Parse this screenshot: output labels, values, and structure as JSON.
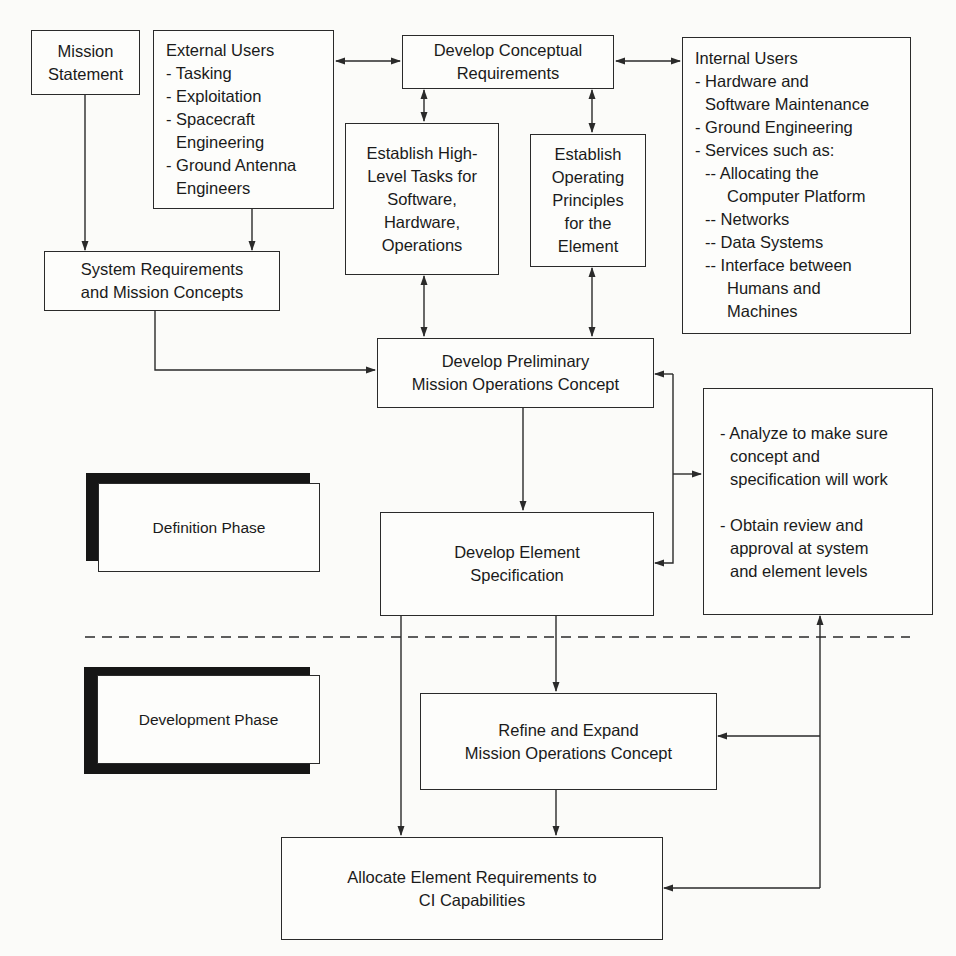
{
  "diagram": {
    "nodes": {
      "mission_statement": {
        "lines": [
          "Mission",
          "Statement"
        ]
      },
      "external_users": {
        "title": "External Users",
        "items": [
          "- Tasking",
          "- Exploitation",
          "- Spacecraft",
          "Engineering",
          "- Ground Antenna",
          "Engineers"
        ]
      },
      "develop_conceptual_requirements": {
        "lines": [
          "Develop Conceptual",
          "Requirements"
        ]
      },
      "internal_users": {
        "title": "Internal Users",
        "items": [
          "- Hardware and",
          "Software Maintenance",
          "- Ground Engineering",
          "- Services such as:",
          "-- Allocating the",
          "Computer Platform",
          "-- Networks",
          "-- Data Systems",
          "-- Interface between",
          "Humans and",
          "Machines"
        ]
      },
      "establish_high_level_tasks": {
        "lines": [
          "Establish High-",
          "Level Tasks for",
          "Software,",
          "Hardware,",
          "Operations"
        ]
      },
      "establish_operating_principles": {
        "lines": [
          "Establish",
          "Operating",
          "Principles",
          "for the",
          "Element"
        ]
      },
      "system_requirements": {
        "lines": [
          "System Requirements",
          "and Mission Concepts"
        ]
      },
      "develop_preliminary_moc": {
        "lines": [
          "Develop Preliminary",
          "Mission Operations Concept"
        ]
      },
      "analyze_review": {
        "items": [
          "- Analyze to make sure",
          "concept and",
          "specification will work",
          "- Obtain review and",
          "approval at system",
          "and element levels"
        ]
      },
      "develop_element_specification": {
        "lines": [
          "Develop Element",
          "Specification"
        ]
      },
      "refine_expand_moc": {
        "lines": [
          "Refine and Expand",
          "Mission Operations Concept"
        ]
      },
      "allocate_requirements": {
        "lines": [
          "Allocate Element Requirements to",
          "CI Capabilities"
        ]
      }
    },
    "phases": {
      "definition": {
        "label": "Definition Phase"
      },
      "development": {
        "label": "Development Phase"
      }
    },
    "edges": [
      {
        "from": "mission_statement",
        "to": "system_requirements",
        "type": "arrow"
      },
      {
        "from": "external_users",
        "to": "system_requirements",
        "type": "arrow"
      },
      {
        "from": "external_users",
        "to": "develop_conceptual_requirements",
        "type": "bidirectional"
      },
      {
        "from": "develop_conceptual_requirements",
        "to": "internal_users",
        "type": "bidirectional"
      },
      {
        "from": "develop_conceptual_requirements",
        "to": "establish_high_level_tasks",
        "type": "bidirectional"
      },
      {
        "from": "develop_conceptual_requirements",
        "to": "establish_operating_principles",
        "type": "bidirectional"
      },
      {
        "from": "system_requirements",
        "to": "develop_preliminary_moc",
        "type": "arrow"
      },
      {
        "from": "establish_high_level_tasks",
        "to": "develop_preliminary_moc",
        "type": "bidirectional"
      },
      {
        "from": "establish_operating_principles",
        "to": "develop_preliminary_moc",
        "type": "bidirectional"
      },
      {
        "from": "develop_preliminary_moc",
        "to": "develop_element_specification",
        "type": "arrow"
      },
      {
        "from": "analyze_review",
        "to": "develop_preliminary_moc",
        "type": "feedback"
      },
      {
        "from": "analyze_review",
        "to": "develop_element_specification",
        "type": "feedback"
      },
      {
        "from": "develop_element_specification",
        "to": "refine_expand_moc",
        "type": "arrow"
      },
      {
        "from": "develop_element_specification",
        "to": "allocate_requirements",
        "type": "arrow"
      },
      {
        "from": "refine_expand_moc",
        "to": "allocate_requirements",
        "type": "arrow"
      },
      {
        "from": "refine_expand_moc",
        "to": "analyze_review",
        "type": "feedback"
      },
      {
        "from": "allocate_requirements",
        "to": "analyze_review",
        "type": "feedback"
      }
    ],
    "colors": {
      "stroke": "#2a2a2a",
      "background": "#fbfbf9",
      "shadow": "#161616"
    }
  }
}
